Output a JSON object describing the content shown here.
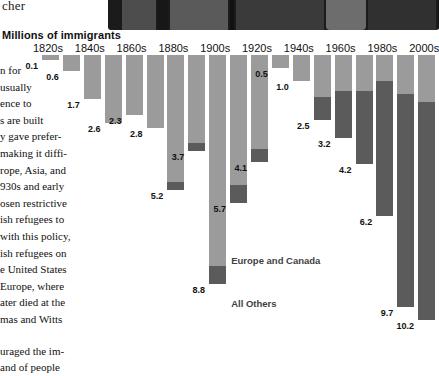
{
  "photo": {
    "caption_partial": "cher",
    "alt_name": "dark-architectural-photo"
  },
  "chart_title": "Millions of immigrants",
  "legend": [
    {
      "label": "Europe and Canada",
      "color": "#9b9b9b",
      "key": "europe_canada"
    },
    {
      "label": "All Others",
      "color": "#5b5b5b",
      "key": "all_others"
    }
  ],
  "axis_labels": [
    "1820s",
    "1840s",
    "1860s",
    "1880s",
    "1900s",
    "1920s",
    "1940s",
    "1960s",
    "1980s",
    "2000s"
  ],
  "body_text": {
    "paragraph_1": "n for usually ence to s are built y gave prefer- making it diffi- rope, Asia, and 930s and early osen restrictive ish refugees to with this policy, ish refugees on e United States Europe, where ater died at the mas and Witts",
    "paragraph_2": "uraged the im- and of people",
    "lines_1": [
      "n for",
      "usually",
      "ence to",
      "s are built",
      "y gave prefer-",
      "making it diffi-",
      "rope, Asia, and",
      "930s and early",
      "osen restrictive",
      "ish refugees to",
      "with this policy,",
      "ish refugees on",
      "e United States",
      "Europe, where",
      "ater died at the",
      "mas and Witts"
    ],
    "lines_2": [
      "uraged the im-",
      "and of people"
    ]
  },
  "chart_data": {
    "type": "bar",
    "stacked": true,
    "title": "Millions of immigrants",
    "xlabel": "",
    "ylabel": "Millions of immigrants",
    "ylim": [
      0,
      10.4
    ],
    "grid": false,
    "legend_position": "inside-center",
    "categories": [
      "1820s",
      "1830s",
      "1840s",
      "1850s",
      "1860s",
      "1870s",
      "1880s",
      "1890s",
      "1900s",
      "1910s",
      "1920s",
      "1930s",
      "1940s",
      "1950s",
      "1960s",
      "1970s",
      "1980s",
      "1990s",
      "2000s"
    ],
    "labeled_categories": [
      "1820s",
      "1840s",
      "1860s",
      "1880s",
      "1900s",
      "1920s",
      "1940s",
      "1960s",
      "1980s",
      "2000s"
    ],
    "totals": [
      0.1,
      0.6,
      1.7,
      2.6,
      2.3,
      2.8,
      5.2,
      3.7,
      8.8,
      5.7,
      4.1,
      0.5,
      1.0,
      2.5,
      3.2,
      4.2,
      6.2,
      9.7,
      10.2
    ],
    "shown_value_labels": [
      "0.1",
      "0.6",
      "1.7",
      "2.6",
      "2.3",
      "2.8",
      "5.2",
      "3.7",
      "8.8",
      "5.7",
      "4.1",
      "0.5",
      "1.0",
      "2.5",
      "3.2",
      "4.2",
      "6.2",
      "9.7",
      "10.2"
    ],
    "series": [
      {
        "name": "Europe and Canada",
        "color": "#9b9b9b",
        "values": [
          0.1,
          0.6,
          1.7,
          2.6,
          2.3,
          2.8,
          4.9,
          3.4,
          8.1,
          5.0,
          3.6,
          0.5,
          1.0,
          1.6,
          1.4,
          1.4,
          1.0,
          1.5,
          1.8
        ]
      },
      {
        "name": "All Others",
        "color": "#5b5b5b",
        "values": [
          0.0,
          0.0,
          0.0,
          0.0,
          0.0,
          0.0,
          0.3,
          0.3,
          0.7,
          0.7,
          0.5,
          0.0,
          0.0,
          0.9,
          1.8,
          2.8,
          5.2,
          8.2,
          8.4
        ]
      }
    ]
  }
}
